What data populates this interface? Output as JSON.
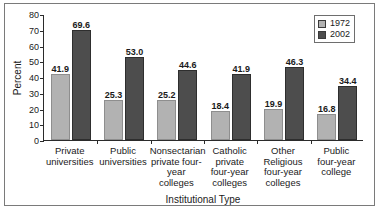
{
  "chart_data": {
    "type": "bar",
    "title": "",
    "xlabel": "Institutional Type",
    "ylabel": "Percent",
    "ylim": [
      0,
      80
    ],
    "yticks": [
      0,
      10,
      20,
      30,
      40,
      50,
      60,
      70,
      80
    ],
    "grid": false,
    "legend_position": "top-right",
    "categories": [
      "Private universities",
      "Public universities",
      "Nonsectarian private four-year colleges",
      "Catholic private four-year colleges",
      "Other Religious four-year colleges",
      "Public four-year college"
    ],
    "category_lines": [
      [
        "Private",
        "universities"
      ],
      [
        "Public",
        "universities"
      ],
      [
        "Nonsectarian",
        "private four-",
        "year colleges"
      ],
      [
        "Catholic",
        "private",
        "four-year",
        "colleges"
      ],
      [
        "Other",
        "Religious",
        "four-year",
        "colleges"
      ],
      [
        "Public",
        "four-year",
        "college"
      ]
    ],
    "series": [
      {
        "name": "1972",
        "color": "#b2b2b2",
        "values": [
          41.9,
          25.3,
          25.2,
          18.4,
          19.9,
          16.8
        ],
        "labels": [
          "41.9",
          "25.3",
          "25.2",
          "18.4",
          "19.9",
          "16.8"
        ]
      },
      {
        "name": "2002",
        "color": "#4d4d4d",
        "values": [
          69.6,
          53.0,
          44.6,
          41.9,
          46.3,
          34.4
        ],
        "labels": [
          "69.6",
          "53.0",
          "44.6",
          "41.9",
          "46.3",
          "34.4"
        ]
      }
    ]
  },
  "legend": {
    "items": [
      {
        "label": "1972",
        "color": "#b2b2b2"
      },
      {
        "label": "2002",
        "color": "#4d4d4d"
      }
    ]
  },
  "axes": {
    "y_title": "Percent",
    "x_title": "Institutional Type",
    "y_tick_labels": [
      "0",
      "10",
      "20",
      "30",
      "40",
      "50",
      "60",
      "70",
      "80"
    ]
  }
}
